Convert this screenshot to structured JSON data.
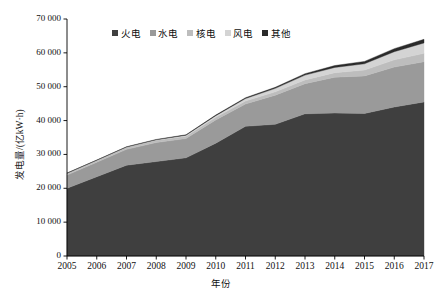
{
  "chart_data": {
    "type": "area",
    "stacked": true,
    "title": "",
    "xlabel": "年份",
    "ylabel": "发电量/(亿kW·h)",
    "x": [
      2005,
      2006,
      2007,
      2008,
      2009,
      2010,
      2011,
      2012,
      2013,
      2014,
      2015,
      2016,
      2017
    ],
    "xtick_labels": [
      "2005",
      "2006",
      "2007",
      "2008",
      "2009",
      "2010",
      "2011",
      "2012",
      "2013",
      "2014",
      "2015",
      "2016",
      "2017"
    ],
    "ytick_labels": [
      "0",
      "10 000",
      "20 000",
      "30 000",
      "40 000",
      "50 000",
      "60 000",
      "70 000"
    ],
    "ytick_values": [
      0,
      10000,
      20000,
      30000,
      40000,
      50000,
      60000,
      70000
    ],
    "ylim": [
      0,
      70000
    ],
    "xlim": [
      2005,
      2017
    ],
    "grid": false,
    "legend_position": "top-center",
    "series": [
      {
        "name": "火电",
        "color": "#3f3f3f",
        "values": [
          20000,
          23400,
          26800,
          27900,
          29000,
          33300,
          38300,
          38900,
          42000,
          42200,
          42100,
          44000,
          45500
        ]
      },
      {
        "name": "水电",
        "color": "#9a9a9a",
        "values": [
          3900,
          4300,
          4700,
          5600,
          5700,
          6900,
          6600,
          8600,
          8900,
          10600,
          11100,
          11800,
          11900
        ]
      },
      {
        "name": "核电",
        "color": "#bdbdbd",
        "values": [
          530,
          540,
          620,
          690,
          700,
          750,
          870,
          980,
          1120,
          1330,
          1710,
          2130,
          2480
        ]
      },
      {
        "name": "风电",
        "color": "#d4d4d4",
        "values": [
          20,
          40,
          60,
          130,
          270,
          500,
          740,
          1030,
          1410,
          1560,
          1860,
          2410,
          3050
        ]
      },
      {
        "name": "其他",
        "color": "#2a2a2a",
        "values": [
          50,
          60,
          80,
          100,
          130,
          180,
          240,
          310,
          420,
          560,
          700,
          900,
          1070
        ]
      }
    ]
  },
  "legend": {
    "items": [
      {
        "label": "火电",
        "color": "#3f3f3f"
      },
      {
        "label": "水电",
        "color": "#9a9a9a"
      },
      {
        "label": "核电",
        "color": "#bdbdbd"
      },
      {
        "label": "风电",
        "color": "#d4d4d4"
      },
      {
        "label": "其他",
        "color": "#2a2a2a"
      }
    ]
  }
}
